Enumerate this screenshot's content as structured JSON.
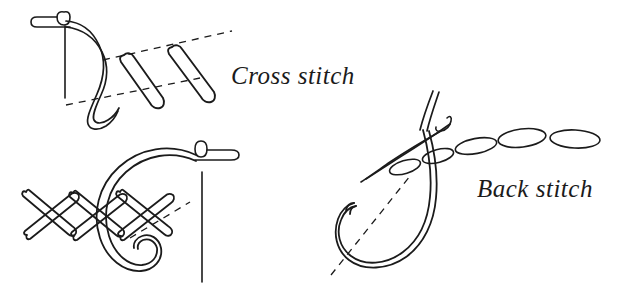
{
  "figure": {
    "background_color": "#ffffff",
    "ink_color": "#1b1b1b",
    "width": 618,
    "height": 295
  },
  "labels": {
    "cross_stitch": "Cross stitch",
    "back_stitch": "Back stitch"
  },
  "diagrams": [
    {
      "name": "cross-stitch-forming",
      "label": "Cross stitch",
      "elements": [
        "needle-horizontal-with-eye",
        "needle-shaft-vertical",
        "thread-s-curve",
        "dashed-guide-line-upper",
        "dashed-guide-line-lower",
        "diagonal-stitch-stroke-1",
        "diagonal-stitch-stroke-2"
      ]
    },
    {
      "name": "cross-stitch-completed",
      "label": "Cross stitch",
      "elements": [
        "crossed-stitch-strokes",
        "needle-horizontal-with-eye",
        "needle-shaft-vertical",
        "thread-loop-curl",
        "dashed-guide-line"
      ]
    },
    {
      "name": "back-stitch",
      "label": "Back stitch",
      "elements": [
        "oval-stitch-chain",
        "needle-diagonal-with-eye",
        "thread-tails",
        "thread-loop-u-shape",
        "dashed-guide-line"
      ]
    }
  ]
}
